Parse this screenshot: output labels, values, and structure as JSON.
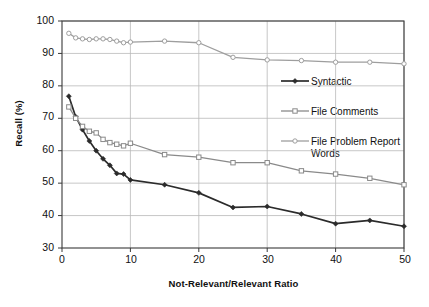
{
  "chart_data": {
    "type": "line",
    "title": "",
    "xlabel": "Not-Relevant/Relevant Ratio",
    "ylabel": "Recall (%)",
    "xlim": [
      0,
      50
    ],
    "ylim": [
      30,
      100
    ],
    "xticks": [
      0,
      10,
      20,
      30,
      40,
      50
    ],
    "yticks": [
      30,
      40,
      50,
      60,
      70,
      80,
      90,
      100
    ],
    "grid": true,
    "legend_position": "inside-right",
    "series": [
      {
        "name": "Syntactic",
        "marker": "diamond",
        "color": "#2b2b2b",
        "x": [
          1,
          2,
          3,
          4,
          5,
          6,
          7,
          8,
          9,
          10,
          15,
          20,
          25,
          30,
          35,
          40,
          45,
          50
        ],
        "y": [
          76.8,
          70.5,
          66.5,
          63.0,
          60.0,
          57.5,
          55.5,
          53.0,
          52.8,
          51.0,
          49.5,
          47.0,
          42.5,
          42.8,
          40.5,
          37.5,
          38.5,
          36.7
        ]
      },
      {
        "name": "File Comments",
        "marker": "square",
        "color": "#8a8a8a",
        "x": [
          1,
          2,
          3,
          4,
          5,
          6,
          7,
          8,
          9,
          10,
          15,
          20,
          25,
          30,
          35,
          40,
          45,
          50
        ],
        "y": [
          73.5,
          70.0,
          67.5,
          66.0,
          65.5,
          63.5,
          62.5,
          62.0,
          61.5,
          62.3,
          58.8,
          58.0,
          56.3,
          56.3,
          53.8,
          52.8,
          51.5,
          49.5
        ]
      },
      {
        "name": "File Problem Report Words",
        "marker": "circle",
        "color": "#9e9e9e",
        "x": [
          1,
          2,
          3,
          4,
          5,
          6,
          7,
          8,
          9,
          10,
          15,
          20,
          25,
          30,
          35,
          40,
          45,
          50
        ],
        "y": [
          96.2,
          94.8,
          94.5,
          94.3,
          94.5,
          94.5,
          94.3,
          93.8,
          93.3,
          93.5,
          93.8,
          93.3,
          88.8,
          88.0,
          87.8,
          87.3,
          87.3,
          86.8
        ]
      }
    ]
  },
  "axes": {
    "y_title": "Recall (%)",
    "x_title": "Not-Relevant/Relevant Ratio",
    "y_tick_labels": [
      "100",
      "90",
      "80",
      "70",
      "60",
      "50",
      "40",
      "30"
    ],
    "x_tick_labels": [
      "0",
      "10",
      "20",
      "30",
      "40",
      "50"
    ]
  },
  "legend": {
    "items": [
      {
        "label": "Syntactic",
        "label_line2": ""
      },
      {
        "label": "File Comments",
        "label_line2": ""
      },
      {
        "label": "File Problem Report",
        "label_line2": "Words"
      }
    ]
  },
  "colors": {
    "syntactic": "#2b2b2b",
    "file_comments": "#8a8a8a",
    "file_problem_report_words": "#9e9e9e",
    "grid": "#b9b9b9",
    "frame": "#3a3a3a",
    "background": "#ffffff"
  }
}
